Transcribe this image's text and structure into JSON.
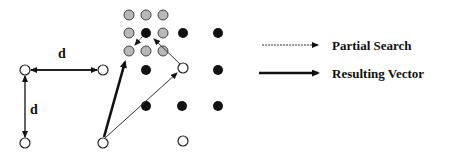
{
  "diagram": {
    "distance_label_horizontal": "d",
    "distance_label_vertical": "d",
    "legend": [
      {
        "label": "Partial Search",
        "style": "thin-dotted-arrow"
      },
      {
        "label": "Resulting Vector",
        "style": "thick-arrow"
      }
    ],
    "colors": {
      "white_node_fill": "#ffffff",
      "gray_node_fill": "#b8b8b8",
      "black_node_fill": "#111111",
      "stroke": "#222222"
    }
  }
}
